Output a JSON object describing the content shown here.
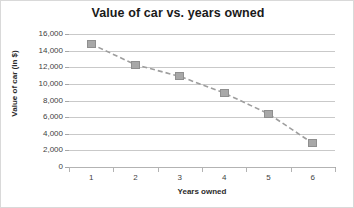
{
  "chart_data": {
    "type": "line",
    "title": "Value of car vs. years owned",
    "xlabel": "Years owned",
    "ylabel": "Value of car (in $)",
    "categories": [
      "1",
      "2",
      "3",
      "4",
      "5",
      "6"
    ],
    "values": [
      14800,
      12300,
      10900,
      8900,
      6400,
      2850
    ],
    "series": [
      {
        "name": "Value of car",
        "values": [
          14800,
          12300,
          10900,
          8900,
          6400,
          2850
        ]
      }
    ],
    "ylim": [
      0,
      16000
    ],
    "y_ticks": [
      0,
      2000,
      4000,
      6000,
      8000,
      10000,
      12000,
      14000,
      16000
    ],
    "y_tick_labels": [
      "0",
      "2,000",
      "4,000",
      "6,000",
      "8,000",
      "10,000",
      "12,000",
      "14,000",
      "16,000"
    ],
    "x_tick_labels": [
      "1",
      "2",
      "3",
      "4",
      "5",
      "6"
    ],
    "grid": "horizontal",
    "legend": "none",
    "marker_style": "square",
    "line_style": "dashed",
    "colors": {
      "marker_fill": "#a8a8a8",
      "marker_edge": "#8f8f8f",
      "line": "#9e9e9e",
      "gridline": "#c9c9c9",
      "axis": "#a6a6a6",
      "title_text": "#1a1a1a",
      "tick_text": "#3f3f3f",
      "background": "#ffffff"
    }
  }
}
